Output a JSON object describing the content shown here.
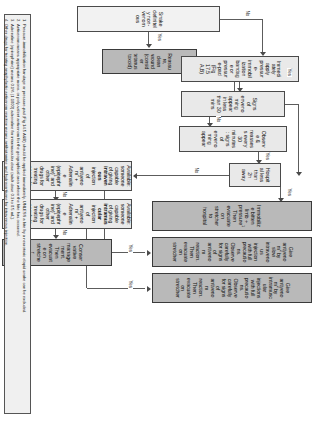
{
  "figure": {
    "orientation_deg": 90
  },
  "nodes": {
    "snake_nonvenomous": "Snake definitely non-venomous",
    "reassure": "Reassure, clean wound (consider tetanus toxoid)",
    "apply_pib": "Immediately apply pressure-immobilization bandage or pressure-pad (Fig 17.5 A,B)",
    "signs_envenoming_30": "Signs of envenoming appear in less than 30 mins",
    "observe_reassess": "Observe &amp; reassess every 30 minutes: signs of envenoming appear",
    "hospital_2h": "Hospital less than 2h away",
    "immobilize_evacuate": "Immobilize bitten limb + pressure<sup>1</sup> Then evacuate on stretcher to hospital",
    "give_iv": "Give antivenom<sup>2</sup> by slow intravenous injection with full precautions. Observe carefully for signs of antivenom reaction. Then evacuate on stretcher",
    "give_im": "Give antivenom<sup>2</sup> by intramuscular injections with full precautions. Observe carefully for signs of antivenom reaction. Then evacuate on stretcher",
    "available_iv": "Available: someone capable of giving <b>intravenous</b> injection of antivenom<sup>2</sup> + Adrenaline (epinephrine)<sup>3</sup> and other drugs for treating anaphylactic antivenom reaction<sup>4</sup>",
    "available_im": "Available: someone capable of giving <b>intramuscular</b> injection of antivenom<sup>2</sup> + Adrenaline (epinephrine)<sup>3</sup> and other drugs for treating anaphylactic antivenom reaction<sup>4</sup>",
    "conservative": "Conservative management. Then evacuate on stretcher"
  },
  "edge_labels": {
    "yes": "Yes",
    "no": "No"
  },
  "footnotes": [
    {
      "num": "1.",
      "text": "Pressure-immobilization bandage or pressure-pad (Fig 14.5 A&B) should be applied immediately, UNLESS a bite by a neurotoxic elapid snake can be excluded."
    },
    {
      "num": "2.",
      "text": "Antivenom means appropriate mono- or poly-valent antivenom for the geographical area where the bite has occurred."
    },
    {
      "num": "3.",
      "text": "Adrenaline (epinephrine) means 0.1% (1:1000) adrenaline for intramuscular dose (adult dose 0.3 to 0.5 mL)."
    },
    {
      "num": "4.",
      "text": "Other drugs for treating anaphylactic antivenom reaction means antihistamine and hydrocortisone for intravenous injection."
    }
  ],
  "colors": {
    "box_light": "#e9e9e9",
    "box_dark": "#b9b9b9",
    "border": "#4a4a4a",
    "line": "#5c5c5c",
    "page": "#ffffff"
  }
}
